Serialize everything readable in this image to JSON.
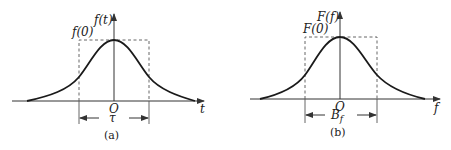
{
  "panels": [
    {
      "id": "a",
      "caption": "(a)",
      "y_axis_label": "f(t)",
      "peak_label": "f(0)",
      "origin_label": "O",
      "x_axis_label": "t",
      "width_label": "τ",
      "description": "Bell-shaped time-domain pulse f(t) with equivalent rectangular width τ"
    },
    {
      "id": "b",
      "caption": "(b)",
      "y_axis_label": "F(f)",
      "peak_label": "F(0)",
      "origin_label": "O",
      "x_axis_label": "f",
      "width_label": "B",
      "width_label_sub": "f",
      "description": "Bell-shaped spectrum F(f) with equivalent rectangular bandwidth B_f"
    }
  ],
  "colors": {
    "curve": "#1a1a1a",
    "axis": "#333333",
    "dashed": "#555555",
    "background": "#ffffff"
  }
}
